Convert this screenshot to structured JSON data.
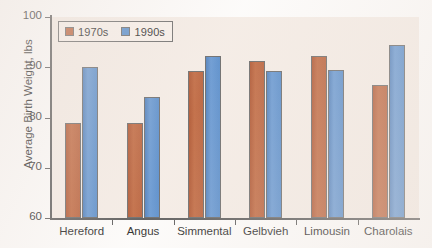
{
  "chart_data": {
    "type": "bar",
    "title": "",
    "xlabel": "",
    "ylabel": "Average Birth Weight, lbs",
    "ylim": [
      60,
      100
    ],
    "yticks": [
      60,
      70,
      80,
      90,
      100
    ],
    "grid": false,
    "legend_position": "top-left",
    "categories": [
      "Hereford",
      "Angus",
      "Simmental",
      "Gelbvieh",
      "Limousin",
      "Charolais"
    ],
    "series": [
      {
        "name": "1970s",
        "color": "#b4552c",
        "values": [
          79.0,
          79.0,
          89.2,
          91.2,
          92.3,
          86.5
        ]
      },
      {
        "name": "1990s",
        "color": "#4a85c8",
        "values": [
          90.0,
          84.1,
          92.2,
          89.3,
          89.4,
          94.5
        ]
      }
    ]
  },
  "axis": {
    "y_label": "Average Birth Weight, lbs",
    "y_ticks": [
      "100",
      "90",
      "80",
      "70",
      "60"
    ]
  },
  "legend": {
    "items": [
      {
        "label": "1970s",
        "swatch": "legend-swatch-1970s"
      },
      {
        "label": "1990s",
        "swatch": "legend-swatch-1990s"
      }
    ]
  },
  "x_categories": [
    "Hereford",
    "Angus",
    "Simmental",
    "Gelbvieh",
    "Limousin",
    "Charolais"
  ]
}
